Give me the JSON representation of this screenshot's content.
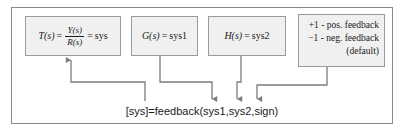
{
  "figure": {
    "boxes": {
      "transfer_function": {
        "lhs": "T(s)",
        "equals": "=",
        "numerator": "Y(s)",
        "denominator": "R(s)",
        "equals2": "=",
        "rhs": "sys"
      },
      "plant": {
        "lhs": "G(s)",
        "equals": "=",
        "rhs": "sys1"
      },
      "feedback_path": {
        "lhs": "H(s)",
        "equals": "=",
        "rhs": "sys2"
      },
      "sign": {
        "line1": "+1 - pos. feedback",
        "line2": "−1 - neg. feedback",
        "line3": "(default)"
      }
    },
    "command": "[sys]=feedback(sys1,sys2,sign)",
    "colors": {
      "box_fill": "#f0f0f0",
      "box_border": "#9a9a9a",
      "frame_border": "#8a8a8a",
      "wire": "#7b7b7b",
      "text": "#1a1a1a",
      "background": "#ffffff"
    }
  }
}
